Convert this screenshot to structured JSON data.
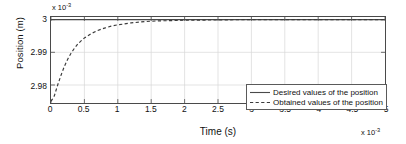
{
  "chart_data": {
    "type": "line",
    "title": "",
    "xlabel": "Time (s)",
    "ylabel": "Position (m)",
    "x_multiplier": "x 10",
    "x_exponent": "-3",
    "y_multiplier": "x 10",
    "y_exponent": "-3",
    "xlim": [
      0,
      5
    ],
    "ylim": [
      2.9745,
      3.0008
    ],
    "xticks": [
      "0",
      "0.5",
      "1",
      "1.5",
      "2",
      "2.5",
      "3",
      "3.5",
      "4",
      "4.5",
      "5"
    ],
    "xtick_values": [
      0,
      0.5,
      1,
      1.5,
      2,
      2.5,
      3,
      3.5,
      4,
      4.5,
      5
    ],
    "yticks": [
      "2.98",
      "2.99",
      "3"
    ],
    "ytick_values": [
      2.98,
      2.99,
      3.0
    ],
    "grid": true,
    "legend_position": "lower right",
    "series": [
      {
        "name": "Desired values of the position",
        "style": "solid",
        "color": "#4a4a4a",
        "x": [
          0,
          0.25,
          0.5,
          0.75,
          1,
          1.5,
          2,
          2.5,
          3,
          3.5,
          4,
          4.5,
          5
        ],
        "values": [
          3,
          3,
          3,
          3,
          3,
          3,
          3,
          3,
          3,
          3,
          3,
          3,
          3
        ]
      },
      {
        "name": "Obtained values of the position",
        "style": "dashed",
        "color": "#3a3a3a",
        "x": [
          0,
          0.05,
          0.1,
          0.15,
          0.2,
          0.25,
          0.3,
          0.35,
          0.4,
          0.45,
          0.5,
          0.6,
          0.7,
          0.8,
          0.9,
          1.0,
          1.2,
          1.4,
          1.6,
          1.8,
          2.0,
          2.5,
          3.0,
          3.5,
          4.0,
          4.5,
          5.0
        ],
        "values": [
          2.975,
          2.9767,
          2.98,
          2.983,
          2.9857,
          2.9879,
          2.9897,
          2.9912,
          2.9925,
          2.9935,
          2.9944,
          2.9957,
          2.9967,
          2.9974,
          2.998,
          2.9984,
          2.999,
          2.9994,
          2.9996,
          2.9997,
          2.9998,
          2.9999,
          3.0,
          3.0,
          3.0,
          3.0,
          3.0
        ]
      }
    ]
  },
  "legend": {
    "items": [
      {
        "label": "Desired values of the position",
        "style": "solid"
      },
      {
        "label": "Obtained values of the position",
        "style": "dashed"
      }
    ]
  }
}
